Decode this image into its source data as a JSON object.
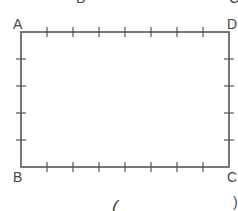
{
  "diagram": {
    "type": "rectangle-with-tick-marks",
    "stroke_color": "#555555",
    "label_color": "#444444",
    "rect": {
      "x1": 21,
      "y1": 32,
      "x2": 229,
      "y2": 167
    },
    "top_side": {
      "segments": 8,
      "ticks": 7
    },
    "bottom_side": {
      "segments": 8,
      "ticks": 7
    },
    "left_side": {
      "segments": 5,
      "ticks": 4
    },
    "right_side": {
      "segments": 5,
      "ticks": 4
    },
    "vertices": [
      {
        "name": "A",
        "label": "A",
        "x": 21,
        "y": 32
      },
      {
        "name": "D",
        "label": "D",
        "x": 229,
        "y": 32
      },
      {
        "name": "B",
        "label": "B",
        "x": 21,
        "y": 167
      },
      {
        "name": "C",
        "label": "C",
        "x": 229,
        "y": 167
      }
    ],
    "cropped_fragments": {
      "top_left": "B",
      "top_right": "C",
      "bottom_left": "(",
      "bottom_right": ")"
    }
  }
}
